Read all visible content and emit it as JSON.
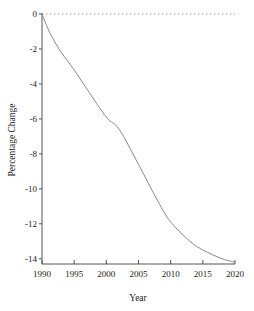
{
  "chart_data": {
    "type": "line",
    "title": "",
    "xlabel": "Year",
    "ylabel": "Percentage Change",
    "xlim": [
      1990,
      2020
    ],
    "ylim": [
      -14.3,
      0
    ],
    "x_ticks": [
      1990,
      1995,
      2000,
      2005,
      2010,
      2015,
      2020
    ],
    "y_ticks": [
      0,
      -2,
      -4,
      -6,
      -8,
      -10,
      -12,
      -14
    ],
    "grid": false,
    "legend": null,
    "reference_line": {
      "y": 0,
      "style": "dotted"
    },
    "series": [
      {
        "name": "Percentage Change",
        "x": [
          1990,
          1991,
          1992,
          1993,
          1995,
          1997,
          2000,
          2002,
          2005,
          2008,
          2010,
          2013,
          2015,
          2018,
          2020
        ],
        "values": [
          0,
          -0.9,
          -1.6,
          -2.2,
          -3.2,
          -4.3,
          -5.9,
          -6.6,
          -8.6,
          -10.7,
          -11.9,
          -13.0,
          -13.5,
          -14.0,
          -14.2
        ]
      }
    ],
    "colors": {
      "line": "#888888",
      "axis": "#555555",
      "reference": "#aaaaaa"
    }
  }
}
